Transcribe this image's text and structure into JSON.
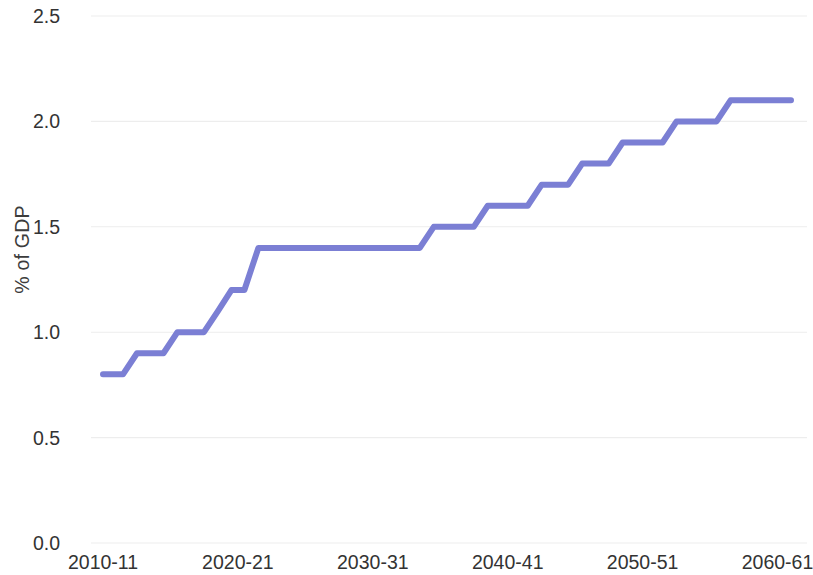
{
  "chart_data": {
    "type": "line",
    "title": "",
    "subtitle": "",
    "xlabel": "",
    "ylabel": "% of GDP",
    "ylim": [
      0.0,
      2.5
    ],
    "xlim": [
      2010,
      2061
    ],
    "grid": true,
    "legend": false,
    "legend_position": "none",
    "line_color": "#7b7fd4",
    "line_width": 6,
    "step_style": "step-like with slanted risers",
    "y_ticks": [
      "0.0",
      "0.5",
      "1.0",
      "1.5",
      "2.0",
      "2.5"
    ],
    "y_tick_values": [
      0.0,
      0.5,
      1.0,
      1.5,
      2.0,
      2.5
    ],
    "x_ticks": [
      "2010-11",
      "2020-21",
      "2030-31",
      "2040-41",
      "2050-51",
      "2060-61"
    ],
    "x_tick_values": [
      2010,
      2020,
      2030,
      2040,
      2050,
      2060
    ],
    "series": [
      {
        "name": "Projected spending",
        "x": [
          2010,
          2011,
          2012,
          2013,
          2014,
          2015,
          2016,
          2017,
          2018,
          2019,
          2020,
          2021,
          2022,
          2023,
          2024,
          2025,
          2026,
          2027,
          2028,
          2029,
          2030,
          2031,
          2032,
          2033,
          2034,
          2035,
          2036,
          2037,
          2038,
          2039,
          2040,
          2041,
          2042,
          2043,
          2044,
          2045,
          2046,
          2047,
          2048,
          2049,
          2050,
          2051,
          2052,
          2053,
          2054,
          2055,
          2056,
          2057,
          2058,
          2059,
          2060,
          2061
        ],
        "values": [
          0.8,
          0.8,
          0.9,
          0.9,
          0.9,
          1.0,
          1.0,
          1.0,
          1.1,
          1.2,
          1.2,
          1.4,
          1.4,
          1.4,
          1.4,
          1.4,
          1.4,
          1.4,
          1.4,
          1.4,
          1.4,
          1.4,
          1.4,
          1.4,
          1.5,
          1.5,
          1.5,
          1.5,
          1.6,
          1.6,
          1.6,
          1.6,
          1.7,
          1.7,
          1.7,
          1.8,
          1.8,
          1.8,
          1.9,
          1.9,
          1.9,
          1.9,
          2.0,
          2.0,
          2.0,
          2.0,
          2.1,
          2.1,
          2.1,
          2.1,
          2.1,
          2.1
        ]
      }
    ]
  },
  "axes": {
    "y_title": "% of GDP"
  }
}
